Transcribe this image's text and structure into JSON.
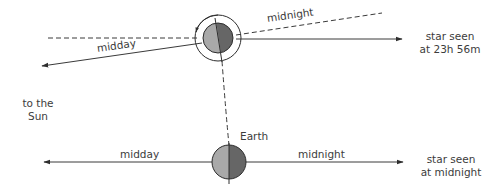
{
  "colors": {
    "line": "#3a3a3a",
    "earth_light": "#a9a9a9",
    "earth_dark": "#666666",
    "earth_outline": "#2e2e2e",
    "text": "#3c3c3c"
  },
  "labels": {
    "top_midday": "midday",
    "top_midnight": "midnight",
    "top_star_line1": "star seen",
    "top_star_line2": "at 23h 56m",
    "sun_line1": "to the",
    "sun_line2": "Sun",
    "earth": "Earth",
    "bottom_midday": "midday",
    "bottom_midnight": "midnight",
    "bottom_star_line1": "star seen",
    "bottom_star_line2": "at midnight"
  },
  "icons": {
    "top_earth": "earth-rotating-icon",
    "bottom_earth": "earth-icon",
    "rotation_ring": "rotation-arrow-icon"
  }
}
